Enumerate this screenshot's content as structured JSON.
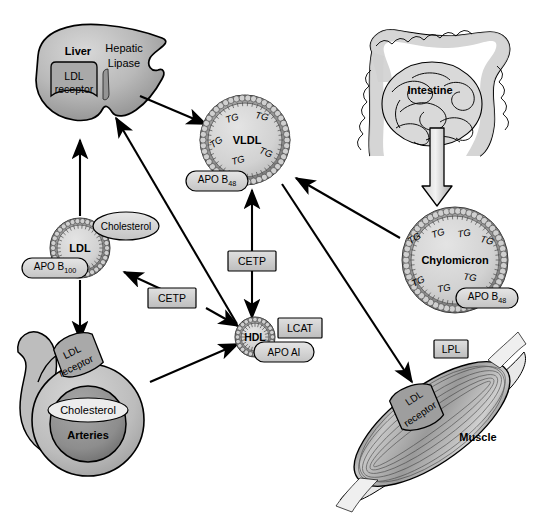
{
  "diagram": {
    "background_color": "#ffffff",
    "line_color": "#000000",
    "fill_light": "#d9d9d9",
    "fill_mid": "#b5b5b5",
    "fill_dark": "#8a8a8a"
  },
  "organs": {
    "liver": {
      "name": "Liver",
      "enzyme": "Hepatic\nLipase",
      "enzyme_line1": "Hepatic",
      "enzyme_line2": "Lipase",
      "receptor_line1": "LDL",
      "receptor_line2": "receptor"
    },
    "intestine": {
      "name": "Intestine"
    },
    "muscle": {
      "name": "Muscle",
      "enzyme": "LPL",
      "receptor_line1": "LDL",
      "receptor_line2": "receptor"
    },
    "arteries": {
      "name": "Arteries",
      "cholesterol": "Cholesterol",
      "receptor_line1": "LDL",
      "receptor_line2": "receptor"
    }
  },
  "particles": {
    "vldl": {
      "name": "VLDL",
      "apo": "APO B",
      "apo_sub": "48",
      "tg_label": "TG",
      "tg_positions": [
        {
          "x": 232,
          "y": 118,
          "rot": -18
        },
        {
          "x": 262,
          "y": 116,
          "rot": 12
        },
        {
          "x": 216,
          "y": 142,
          "rot": -34
        },
        {
          "x": 238,
          "y": 160,
          "rot": -14
        },
        {
          "x": 266,
          "y": 152,
          "rot": 22
        }
      ]
    },
    "ldl": {
      "name": "LDL",
      "apo": "APO B",
      "apo_sub": "100",
      "cholesterol": "Cholesterol"
    },
    "hdl": {
      "name": "HDL",
      "apo": "APO AI",
      "enzyme": "LCAT"
    },
    "chylomicron": {
      "name": "Chylomicron",
      "apo": "APO B",
      "apo_sub": "48",
      "tg_label": "TG",
      "tg_positions": [
        {
          "x": 414,
          "y": 238,
          "rot": -32
        },
        {
          "x": 438,
          "y": 233,
          "rot": -18
        },
        {
          "x": 464,
          "y": 233,
          "rot": -8
        },
        {
          "x": 487,
          "y": 240,
          "rot": 14
        },
        {
          "x": 418,
          "y": 281,
          "rot": -26
        },
        {
          "x": 444,
          "y": 288,
          "rot": -10
        },
        {
          "x": 470,
          "y": 277,
          "rot": 8
        }
      ]
    }
  },
  "enzymes": {
    "cetp_upper": "CETP",
    "cetp_lower": "CETP",
    "lcat": "LCAT",
    "lpl": "LPL",
    "hepatic_lipase": "Hepatic Lipase"
  },
  "arrows": [
    {
      "id": "liver-to-vldl",
      "from": "liver",
      "to": "vldl",
      "direction": "one-way"
    },
    {
      "id": "ldl-to-liver",
      "from": "ldl",
      "to": "liver",
      "direction": "one-way"
    },
    {
      "id": "hdl-to-liver",
      "from": "hdl",
      "to": "liver",
      "direction": "one-way"
    },
    {
      "id": "vldl-hdl-cetp",
      "from": "vldl",
      "to": "hdl",
      "direction": "two-way"
    },
    {
      "id": "cetp-to-ldl",
      "from": "cetp_lower",
      "to": "ldl",
      "direction": "one-way"
    },
    {
      "id": "cetp-to-hdl",
      "from": "cetp_lower",
      "to": "hdl",
      "direction": "one-way"
    },
    {
      "id": "ldl-to-arteries",
      "from": "ldl",
      "to": "arteries",
      "direction": "one-way"
    },
    {
      "id": "arteries-to-hdl",
      "from": "arteries",
      "to": "hdl",
      "direction": "one-way"
    },
    {
      "id": "intestine-to-chylomicron",
      "from": "intestine",
      "to": "chylomicron",
      "direction": "one-way"
    },
    {
      "id": "chylomicron-to-vldl",
      "from": "chylomicron",
      "to": "vldl",
      "direction": "one-way"
    },
    {
      "id": "vldl-to-muscle",
      "from": "vldl",
      "to": "muscle",
      "direction": "one-way"
    }
  ]
}
